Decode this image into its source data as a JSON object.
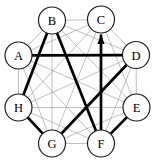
{
  "figure": {
    "type": "graph-diagram",
    "width": 159,
    "height": 165,
    "background_color": "#ffffff"
  },
  "colors": {
    "node_fill": "#ffffff",
    "node_stroke": "#1a1a1a",
    "label_color": "#000000",
    "thin_edge_color": "#8c8c8c",
    "bold_edge_color": "#000000"
  },
  "nodes": [
    {
      "id": "A",
      "label": "A",
      "cx": 18.5,
      "cy": 55.5,
      "r": 13.5
    },
    {
      "id": "B",
      "label": "B",
      "cx": 52.0,
      "cy": 20.5,
      "r": 13.5
    },
    {
      "id": "C",
      "label": "C",
      "cx": 101.0,
      "cy": 19.5,
      "r": 13.5
    },
    {
      "id": "D",
      "label": "D",
      "cx": 136.0,
      "cy": 55.0,
      "r": 13.5
    },
    {
      "id": "E",
      "label": "E",
      "cx": 136.5,
      "cy": 107.5,
      "r": 13.5
    },
    {
      "id": "F",
      "label": "F",
      "cx": 101.0,
      "cy": 143.5,
      "r": 13.5
    },
    {
      "id": "G",
      "label": "G",
      "cx": 52.0,
      "cy": 143.5,
      "r": 13.5
    },
    {
      "id": "H",
      "label": "H",
      "cx": 18.5,
      "cy": 107.5,
      "r": 13.5
    }
  ],
  "thin_edges": [
    [
      "A",
      "B"
    ],
    [
      "A",
      "C"
    ],
    [
      "A",
      "D"
    ],
    [
      "A",
      "E"
    ],
    [
      "A",
      "F"
    ],
    [
      "A",
      "G"
    ],
    [
      "A",
      "H"
    ],
    [
      "B",
      "C"
    ],
    [
      "B",
      "D"
    ],
    [
      "B",
      "E"
    ],
    [
      "B",
      "F"
    ],
    [
      "B",
      "G"
    ],
    [
      "B",
      "H"
    ],
    [
      "C",
      "D"
    ],
    [
      "C",
      "E"
    ],
    [
      "C",
      "F"
    ],
    [
      "C",
      "G"
    ],
    [
      "C",
      "H"
    ],
    [
      "D",
      "E"
    ],
    [
      "D",
      "F"
    ],
    [
      "D",
      "G"
    ],
    [
      "D",
      "H"
    ],
    [
      "E",
      "F"
    ],
    [
      "E",
      "G"
    ],
    [
      "E",
      "H"
    ],
    [
      "F",
      "G"
    ],
    [
      "F",
      "H"
    ],
    [
      "G",
      "H"
    ]
  ],
  "bold_edges": [
    {
      "from": "A",
      "to": "D",
      "arrow": false
    },
    {
      "from": "B",
      "to": "H",
      "arrow": false
    },
    {
      "from": "B",
      "to": "F",
      "arrow": false
    },
    {
      "from": "H",
      "to": "G",
      "arrow": false
    },
    {
      "from": "G",
      "to": "D",
      "arrow": false
    },
    {
      "from": "F",
      "to": "E",
      "arrow": false
    },
    {
      "from": "F",
      "to": "C",
      "arrow": true
    }
  ]
}
